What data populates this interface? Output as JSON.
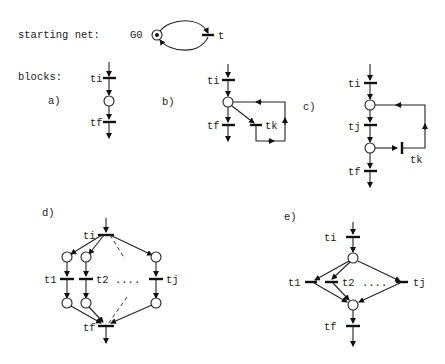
{
  "figure": {
    "starting_net_label": "starting net:",
    "blocks_label": "blocks:",
    "starting_net": {
      "place": "G0",
      "transition": "t",
      "marked": true
    },
    "blocks": {
      "a": {
        "tag": "a)",
        "ti": "ti",
        "tf": "tf"
      },
      "b": {
        "tag": "b)",
        "ti": "ti",
        "tf": "tf",
        "tk": "tk"
      },
      "c": {
        "tag": "c)",
        "ti": "ti",
        "tj": "tj",
        "tf": "tf",
        "tk": "tk"
      },
      "d": {
        "tag": "d)",
        "ti": "ti",
        "t1": "t1",
        "t2": "t2",
        "dots": "....",
        "tj": "tj",
        "tf": "tf"
      },
      "e": {
        "tag": "e)",
        "ti": "ti",
        "t1": "t1",
        "t2": "t2",
        "dots": "....",
        "tj": "tj",
        "tf": "tf"
      }
    }
  }
}
